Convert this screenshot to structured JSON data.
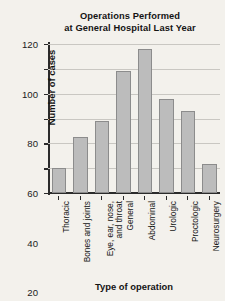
{
  "chart_data": {
    "type": "bar",
    "title": "Operations Performed at General Hospital Last Year",
    "title_lines": [
      "Operations Performed",
      "at General Hospital Last Year"
    ],
    "xlabel": "Type of operation",
    "ylabel": "Number of cases",
    "categories": [
      "Thoracic",
      "Bones and joints",
      "Eye, ear, nose,\nand throat",
      "General",
      "Abdominal",
      "Urologic",
      "Proctologic",
      "Neurosurgery"
    ],
    "values": [
      20,
      45,
      58,
      98,
      116,
      76,
      66,
      23
    ],
    "ylim": [
      0,
      120
    ],
    "yticks": [
      0,
      20,
      40,
      60,
      80,
      100,
      120
    ],
    "ytick_labels": [
      "0",
      "20",
      "40",
      "60",
      "80",
      "100",
      "120"
    ],
    "grid": true,
    "legend": "none",
    "bar_color": "#bcbcbc",
    "bar_edge_color": "#8c8c8c",
    "background_color": "#f3f1ec",
    "gridline_color": "#c9c7c2",
    "axis_color": "#2b2b2b"
  }
}
